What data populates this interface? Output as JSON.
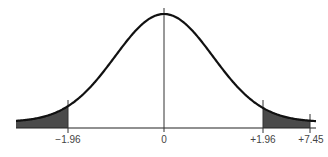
{
  "chart_data": {
    "type": "area",
    "title": "",
    "subtitle": "",
    "xlabel": "",
    "ylabel": "",
    "tick_labels": [
      "−1.96",
      "0",
      "+1.96",
      "+7.45"
    ],
    "tick_values": [
      -1.96,
      0,
      1.96,
      7.45
    ],
    "curve": {
      "distribution": "normal",
      "mean": 0,
      "sd": 1
    },
    "shaded_regions": [
      {
        "name": "left-tail",
        "from": "-inf",
        "to": -1.96
      },
      {
        "name": "right-tail",
        "from": 1.96,
        "to": 7.45
      }
    ],
    "grid": false,
    "legend": "none",
    "colors": {
      "curve": "#111111",
      "shade": "#4a4a4a",
      "axis": "#222222",
      "label": "#444444"
    }
  }
}
